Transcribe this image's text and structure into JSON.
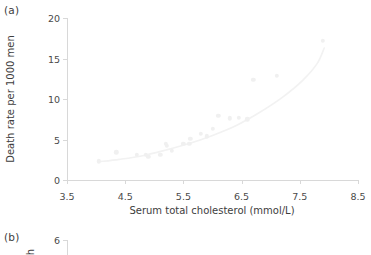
{
  "panels": {
    "a": {
      "letter": "(a)"
    },
    "b": {
      "letter": "(b)"
    }
  },
  "chart_data": {
    "type": "scatter",
    "title": "",
    "xlabel": "Serum total cholesterol (mmol/L)",
    "ylabel": "Death rate per 1000 men",
    "xlim": [
      3.5,
      8.5
    ],
    "ylim": [
      0,
      20
    ],
    "xticks": [
      3.5,
      4.5,
      5.5,
      6.5,
      7.5,
      8.5
    ],
    "xtick_labels": [
      "3.5",
      "4.5",
      "5.5",
      "6.5",
      "7.5",
      "8.5"
    ],
    "yticks": [
      0,
      5,
      10,
      15,
      20
    ],
    "ytick_labels": [
      "0",
      "5",
      "10",
      "15",
      "20"
    ],
    "grid": false,
    "legend": null,
    "marker_color": "#f0f0f0",
    "line_color": "#f2f2f2",
    "axis_color": "#d8d8d8",
    "points": [
      {
        "x": 4.05,
        "y": 2.3
      },
      {
        "x": 4.35,
        "y": 3.4
      },
      {
        "x": 4.7,
        "y": 3.1
      },
      {
        "x": 4.85,
        "y": 3.1
      },
      {
        "x": 4.9,
        "y": 2.9
      },
      {
        "x": 5.1,
        "y": 3.1
      },
      {
        "x": 5.2,
        "y": 4.5
      },
      {
        "x": 5.22,
        "y": 4.2
      },
      {
        "x": 5.3,
        "y": 3.6
      },
      {
        "x": 5.5,
        "y": 4.5
      },
      {
        "x": 5.6,
        "y": 4.5
      },
      {
        "x": 5.62,
        "y": 5.1
      },
      {
        "x": 5.8,
        "y": 5.7
      },
      {
        "x": 5.9,
        "y": 5.4
      },
      {
        "x": 6.0,
        "y": 6.3
      },
      {
        "x": 6.1,
        "y": 7.9
      },
      {
        "x": 6.3,
        "y": 7.6
      },
      {
        "x": 6.45,
        "y": 7.7
      },
      {
        "x": 6.6,
        "y": 7.5
      },
      {
        "x": 6.7,
        "y": 12.4
      },
      {
        "x": 7.1,
        "y": 12.9
      },
      {
        "x": 7.9,
        "y": 17.2
      }
    ],
    "fit_curve": [
      {
        "x": 4.05,
        "y": 2.25
      },
      {
        "x": 4.4,
        "y": 2.55
      },
      {
        "x": 4.8,
        "y": 3.0
      },
      {
        "x": 5.2,
        "y": 3.7
      },
      {
        "x": 5.6,
        "y": 4.5
      },
      {
        "x": 6.0,
        "y": 5.5
      },
      {
        "x": 6.4,
        "y": 6.7
      },
      {
        "x": 6.8,
        "y": 8.3
      },
      {
        "x": 7.2,
        "y": 10.2
      },
      {
        "x": 7.55,
        "y": 12.3
      },
      {
        "x": 7.8,
        "y": 14.4
      },
      {
        "x": 7.92,
        "y": 16.3
      }
    ]
  },
  "panel_b_chart": {
    "type": "scatter",
    "yticks": [
      6
    ],
    "ytick_labels": [
      "6"
    ],
    "ylabel_partial": "h"
  }
}
